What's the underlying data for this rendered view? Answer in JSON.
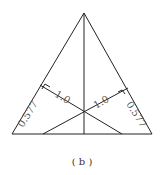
{
  "figure": {
    "caption": "( b )",
    "labels": {
      "left_side": "0.577",
      "left_perp": "1.0",
      "right_perp": "1.0",
      "right_side": "0.577"
    },
    "colors": {
      "stroke": "#222222",
      "label": "#555555",
      "background": "#ffffff"
    }
  }
}
